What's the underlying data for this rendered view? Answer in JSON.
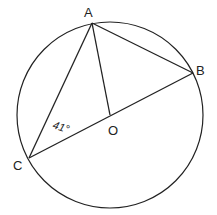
{
  "figure": {
    "circle": {
      "cx": 110,
      "cy": 115,
      "r": 93
    },
    "points": {
      "A": {
        "label": "A",
        "x": 92,
        "y": 23
      },
      "B": {
        "label": "B",
        "x": 193,
        "y": 73
      },
      "C": {
        "label": "C",
        "x": 29,
        "y": 158
      },
      "O": {
        "label": "O",
        "x": 110,
        "y": 115
      }
    },
    "segments": [
      "AB",
      "AC",
      "AO",
      "CB"
    ],
    "angle_label": {
      "text": "41°",
      "at": "C",
      "between": [
        "CA",
        "CB"
      ]
    }
  },
  "labels": {
    "A": "A",
    "B": "B",
    "C": "C",
    "O": "O",
    "angle": "41°"
  }
}
